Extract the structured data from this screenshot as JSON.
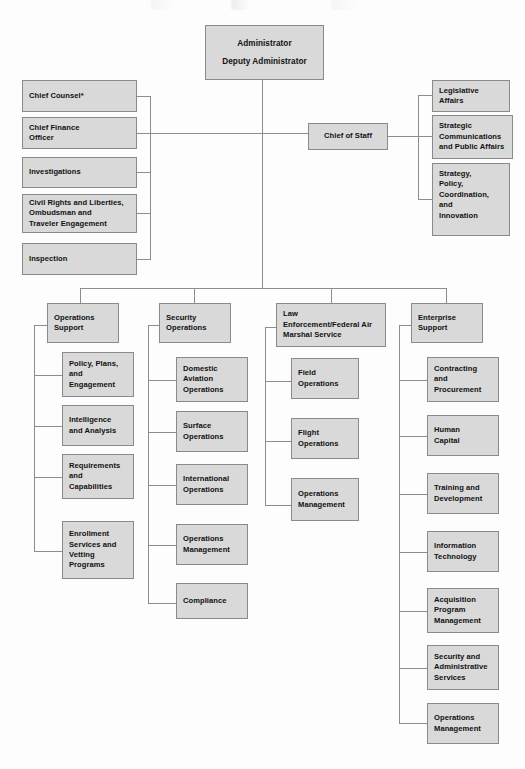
{
  "document": {
    "kind": "organizational-chart",
    "title": "Transportation Security Administration Organizational Chart"
  },
  "root": {
    "id": "administrator",
    "label": "Administrator\nDeputy Administrator",
    "line1": "Administrator",
    "line2": "Deputy Administrator"
  },
  "chief_of_staff": {
    "id": "chief-of-staff",
    "label": "Chief of Staff"
  },
  "left_offices": [
    {
      "id": "chief-counsel",
      "label": "Chief Counsel*"
    },
    {
      "id": "chief-finance-officer",
      "label": "Chief Finance\nOfficer"
    },
    {
      "id": "investigations",
      "label": "Investigations"
    },
    {
      "id": "civil-rights",
      "label": "Civil Rights and Liberties,\nOmbudsman and\nTraveler Engagement"
    },
    {
      "id": "inspection",
      "label": "Inspection"
    }
  ],
  "right_offices": [
    {
      "id": "legislative-affairs",
      "label": "Legislative\nAffairs"
    },
    {
      "id": "strategic-communications",
      "label": "Strategic\nCommunications\nand Public Affairs"
    },
    {
      "id": "strategy-policy",
      "label": "Strategy,\nPolicy,\nCoordination,\nand\nInnovation"
    }
  ],
  "divisions": [
    {
      "id": "operations-support",
      "label": "Operations\nSupport",
      "children": [
        {
          "id": "policy-plans-engagement",
          "label": "Policy, Plans,\nand\nEngagement"
        },
        {
          "id": "intelligence-and-analysis",
          "label": "Intelligence\nand Analysis"
        },
        {
          "id": "requirements-and-capabilities",
          "label": "Requirements\nand\nCapabilities"
        },
        {
          "id": "enrollment-services-vetting",
          "label": "Enrollment\nServices and\nVetting\nPrograms"
        }
      ]
    },
    {
      "id": "security-operations",
      "label": "Security\nOperations",
      "children": [
        {
          "id": "domestic-aviation-operations",
          "label": "Domestic\nAviation\nOperations"
        },
        {
          "id": "surface-operations",
          "label": "Surface\nOperations"
        },
        {
          "id": "international-operations",
          "label": "International\nOperations"
        },
        {
          "id": "operations-management-security",
          "label": "Operations\nManagement"
        },
        {
          "id": "compliance",
          "label": "Compliance"
        }
      ]
    },
    {
      "id": "law-enforcement-fams",
      "label": "Law\nEnforcement/Federal Air\nMarshal Service",
      "children": [
        {
          "id": "field-operations",
          "label": "Field\nOperations"
        },
        {
          "id": "flight-operations",
          "label": "Flight\nOperations"
        },
        {
          "id": "operations-management-le",
          "label": "Operations\nManagement"
        }
      ]
    },
    {
      "id": "enterprise-support",
      "label": "Enterprise\nSupport",
      "children": [
        {
          "id": "contracting-and-procurement",
          "label": "Contracting\nand\nProcurement"
        },
        {
          "id": "human-capital",
          "label": "Human\nCapital"
        },
        {
          "id": "training-and-development",
          "label": "Training and\nDevelopment"
        },
        {
          "id": "information-technology",
          "label": "Information\nTechnology"
        },
        {
          "id": "acquisition-program-management",
          "label": "Acquisition\nProgram\nManagement"
        },
        {
          "id": "security-administrative-services",
          "label": "Security and\nAdministrative\nServices"
        },
        {
          "id": "operations-management-enterprise",
          "label": "Operations\nManagement"
        }
      ]
    }
  ],
  "colors": {
    "box_fill": "#d9d9d9",
    "box_border": "#8a8a8a",
    "connector": "#8c8c8c",
    "text": "#111111",
    "page_background": "#fdfdfd"
  }
}
